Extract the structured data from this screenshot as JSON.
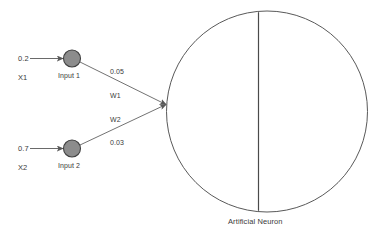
{
  "diagram": {
    "background_color": "#ffffff",
    "line_color": "#595959",
    "node_fill_color": "#8c8c8c",
    "node_stroke_color": "#404040",
    "text_color": "#3a3a3a",
    "inputs": [
      {
        "signal_value": "0.2",
        "variable_label": "X1",
        "node_label": "Input 1",
        "weight_value": "0.05",
        "weight_label": "W1"
      },
      {
        "signal_value": "0.7",
        "variable_label": "X2",
        "node_label": "Input 2",
        "weight_value": "0.03",
        "weight_label": "W2"
      }
    ],
    "neuron": {
      "caption": "Artificial Neuron"
    }
  }
}
